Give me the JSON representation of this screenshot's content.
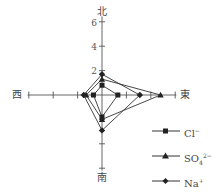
{
  "chart_data": {
    "type": "radar",
    "title": "",
    "axes": [
      "北",
      "東",
      "南",
      "西"
    ],
    "axes_english": [
      "North",
      "East",
      "South",
      "West"
    ],
    "tick_labels": [
      "2",
      "4",
      "6"
    ],
    "range": [
      0,
      7
    ],
    "grid": false,
    "legend_position": "bottom-right",
    "series": [
      {
        "name": "Cl⁻",
        "marker": "square",
        "values": {
          "北": 0.8,
          "東": 1.3,
          "南": 1.8,
          "西": 0.7
        }
      },
      {
        "name": "SO₄²⁻",
        "marker": "triangle",
        "values": {
          "北": 1.3,
          "東": 4.8,
          "南": 2.0,
          "西": 1.3
        }
      },
      {
        "name": "Na⁺",
        "marker": "diamond",
        "values": {
          "北": 1.7,
          "東": 3.1,
          "南": 2.9,
          "西": 1.5
        }
      }
    ]
  },
  "labels": {
    "north": "北",
    "east": "東",
    "south": "南",
    "west": "西",
    "tick_2": "2",
    "tick_4": "4",
    "tick_6": "6"
  },
  "legend": {
    "items": [
      {
        "base": "Cl",
        "sup": "−",
        "marker": "square"
      },
      {
        "base": "SO",
        "sub": "4",
        "sup": "2−",
        "marker": "triangle"
      },
      {
        "base": "Na",
        "sup": "+",
        "marker": "diamond"
      }
    ]
  },
  "colors": {
    "line": "#333333",
    "axis": "#555555",
    "marker": "#222222"
  }
}
